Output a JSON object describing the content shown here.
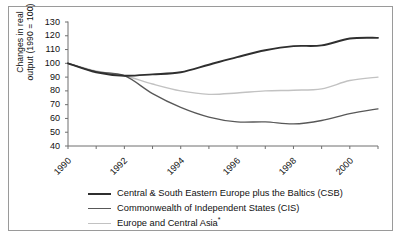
{
  "chart_data": {
    "type": "line",
    "title": "",
    "xlabel": "",
    "ylabel": "Changes in real output (1990 = 100)",
    "ylabel_line1": "Changes in real",
    "ylabel_line2": "output (1990 = 100)",
    "xlim": [
      1990,
      2001
    ],
    "ylim": [
      40,
      130
    ],
    "yticks": [
      40,
      50,
      60,
      70,
      80,
      90,
      100,
      110,
      120,
      130
    ],
    "xticks": [
      1990,
      1991,
      1992,
      1993,
      1994,
      1995,
      1996,
      1997,
      1998,
      1999,
      2000,
      2001
    ],
    "xtick_labels": [
      "1990",
      "",
      "1992",
      "",
      "1994",
      "",
      "1996",
      "",
      "1998",
      "",
      "2000",
      ""
    ],
    "grid": false,
    "legend_position": "below",
    "x": [
      1990,
      1991,
      1992,
      1993,
      1994,
      1995,
      1996,
      1997,
      1998,
      1999,
      2000,
      2001
    ],
    "series": [
      {
        "name": "Central & South Eastern Europe plus the Baltics (CSB)",
        "short": "CSB",
        "color": "#2f2f2f",
        "width": 1.9,
        "values": [
          100,
          93.5,
          91.0,
          92.0,
          93.5,
          99.0,
          104.5,
          109.5,
          112.5,
          113.0,
          118.0,
          118.5
        ]
      },
      {
        "name": "Commonwealth of Independent States (CIS)",
        "short": "CIS",
        "color": "#585858",
        "width": 1.3,
        "values": [
          100,
          94.0,
          91.0,
          78.0,
          68.0,
          61.0,
          57.5,
          57.5,
          56.0,
          58.5,
          63.5,
          67.0
        ]
      },
      {
        "name": "Europe and Central Asia*",
        "short": "ECA",
        "color": "#c2c2c2",
        "width": 1.4,
        "values": [
          100,
          94.5,
          91.0,
          85.0,
          80.0,
          77.5,
          78.5,
          80.0,
          80.5,
          81.5,
          87.5,
          90.0
        ]
      }
    ]
  },
  "legend": {
    "items": [
      {
        "label": "Central & South Eastern Europe plus the Baltics (CSB)",
        "color": "#2f2f2f",
        "width": 2.4
      },
      {
        "label": "Commonwealth of Independent States (CIS)",
        "color": "#585858",
        "width": 1.6
      },
      {
        "label": "Europe and Central Asia",
        "suffix": "*",
        "color": "#c2c2c2",
        "width": 1.6
      }
    ]
  },
  "colors": {
    "border": "#9a9a9a",
    "axis": "#6f6f6f",
    "text": "#111111",
    "background": "#ffffff"
  }
}
